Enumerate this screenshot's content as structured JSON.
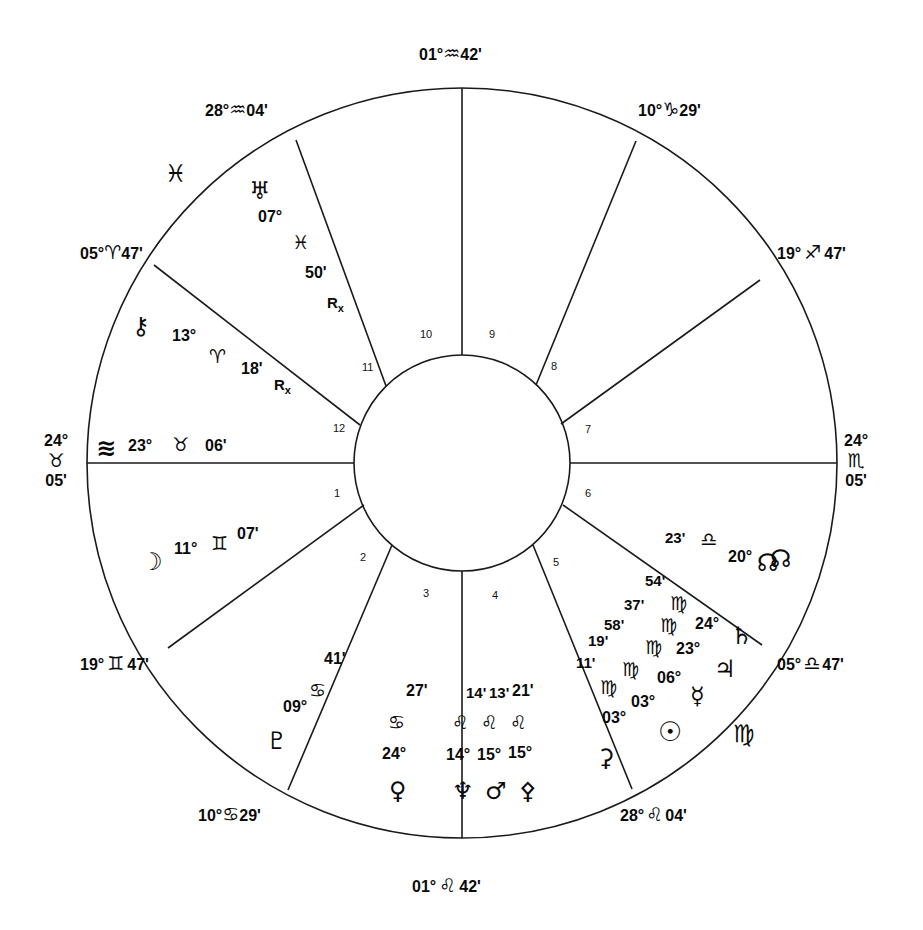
{
  "chart": {
    "type": "astrological-wheel",
    "title": "",
    "house_count": 12,
    "colors": {
      "line": "#1a1a1a",
      "text": "#0a0a0a",
      "background": "#ffffff"
    },
    "cusp_labels": [
      {
        "id": "cusp-10-mc",
        "text": "01°♐542'",
        "degree": "01°",
        "sign": "♒",
        "minute": "42'",
        "position": "top-center"
      },
      {
        "id": "cusp-11",
        "text": "28°♒04'",
        "degree": "28°",
        "sign": "♒",
        "minute": "04'",
        "position": "top-left"
      },
      {
        "id": "cusp-9",
        "text": "10°♑29'",
        "degree": "10°",
        "sign": "♑",
        "minute": "29'",
        "position": "top-right"
      },
      {
        "id": "cusp-12",
        "text": "05°♈47'",
        "degree": "05°",
        "sign": "♈",
        "minute": "47'",
        "position": "left-upper"
      },
      {
        "id": "cusp-8",
        "text": "19°♐ 47'",
        "degree": "19°",
        "sign": "♐",
        "minute": "47'",
        "position": "right-upper"
      },
      {
        "id": "cusp-1-asc",
        "degree": "24°",
        "sign": "♉",
        "minute": "05'",
        "position": "left-center",
        "stacked": true
      },
      {
        "id": "cusp-7-dsc",
        "degree": "24°",
        "sign": "♏",
        "minute": "05'",
        "position": "right-center",
        "stacked": true
      },
      {
        "id": "cusp-2",
        "text": "19°♊47'",
        "degree": "19°",
        "sign": "♊",
        "minute": "47'",
        "position": "left-lower"
      },
      {
        "id": "cusp-6",
        "text": "05°♎47'",
        "degree": "05°",
        "sign": "♎",
        "minute": "47'",
        "position": "right-lower"
      },
      {
        "id": "cusp-3",
        "text": "10°♋29'",
        "degree": "10°",
        "sign": "♋",
        "minute": "29'",
        "position": "bottom-left"
      },
      {
        "id": "cusp-5",
        "text": "28°♌04'",
        "degree": "28°",
        "sign": "♌",
        "minute": "04'",
        "position": "bottom-right"
      },
      {
        "id": "cusp-4-ic",
        "text": "01°♌ 42'",
        "degree": "01°",
        "sign": "♌",
        "minute": "42'",
        "position": "bottom-center"
      }
    ],
    "house_numbers": [
      "1",
      "2",
      "3",
      "4",
      "5",
      "6",
      "7",
      "8",
      "9",
      "10",
      "11",
      "12"
    ],
    "outer_sign_marks": [
      {
        "id": "sign-mark-pisces",
        "glyph": "♓"
      },
      {
        "id": "sign-mark-north-node",
        "glyph": "☊"
      },
      {
        "id": "sign-mark-virgo",
        "glyph": "♍"
      }
    ],
    "planets": [
      {
        "id": "uranus",
        "name": "Uranus",
        "glyph": "♅",
        "degree": "07°",
        "sign": "♓",
        "minute": "50'",
        "retrograde": true,
        "house": 11
      },
      {
        "id": "chiron",
        "name": "Chiron",
        "glyph": "⚷",
        "degree": "13°",
        "sign": "♈",
        "minute": "18'",
        "retrograde": true,
        "house": 12
      },
      {
        "id": "ascendant",
        "name": "Ascendant",
        "glyph": "≋",
        "degree": "23°",
        "sign": "♉",
        "minute": "06'",
        "retrograde": false,
        "house": 1
      },
      {
        "id": "moon",
        "name": "Moon",
        "glyph": "☽",
        "degree": "11°",
        "sign": "♊",
        "minute": "07'",
        "retrograde": false,
        "house": 1
      },
      {
        "id": "pluto",
        "name": "Pluto",
        "glyph": "♇",
        "degree": "09°",
        "sign": "♋",
        "minute": "41'",
        "retrograde": false,
        "house": 2
      },
      {
        "id": "venus",
        "name": "Venus",
        "glyph": "♀",
        "degree": "24°",
        "sign": "♋",
        "minute": "27'",
        "retrograde": false,
        "house": 3
      },
      {
        "id": "neptune",
        "name": "Neptune",
        "glyph": "♆",
        "degree": "14°",
        "sign": "♌",
        "minute": "14'",
        "retrograde": false,
        "house": 4
      },
      {
        "id": "mars",
        "name": "Mars",
        "glyph": "♂",
        "degree": "15°",
        "sign": "♌",
        "minute": "13'",
        "retrograde": false,
        "house": 4
      },
      {
        "id": "pallas",
        "name": "Pallas",
        "glyph": "⚴",
        "degree": "15°",
        "sign": "♌",
        "minute": "21'",
        "retrograde": false,
        "house": 4
      },
      {
        "id": "ceres",
        "name": "Ceres",
        "glyph": "⚳",
        "degree": "03°",
        "sign": "♍",
        "minute": "11'",
        "retrograde": false,
        "house": 5
      },
      {
        "id": "sun",
        "name": "Sun",
        "glyph": "☉",
        "degree": "03°",
        "sign": "♍",
        "minute": "19'",
        "retrograde": false,
        "house": 5
      },
      {
        "id": "mercury",
        "name": "Mercury",
        "glyph": "☿",
        "degree": "06°",
        "sign": "♍",
        "minute": "58'",
        "retrograde": false,
        "house": 5
      },
      {
        "id": "jupiter",
        "name": "Jupiter",
        "glyph": "♃",
        "degree": "23°",
        "sign": "♍",
        "minute": "37'",
        "retrograde": false,
        "house": 6
      },
      {
        "id": "saturn",
        "name": "Saturn",
        "glyph": "♄",
        "degree": "24°",
        "sign": "♍",
        "minute": "54'",
        "retrograde": false,
        "house": 6
      },
      {
        "id": "north_node",
        "name": "North Node",
        "glyph": "☊",
        "degree": "20°",
        "sign": "♎",
        "minute": "23'",
        "retrograde": false,
        "house": 6
      }
    ]
  }
}
